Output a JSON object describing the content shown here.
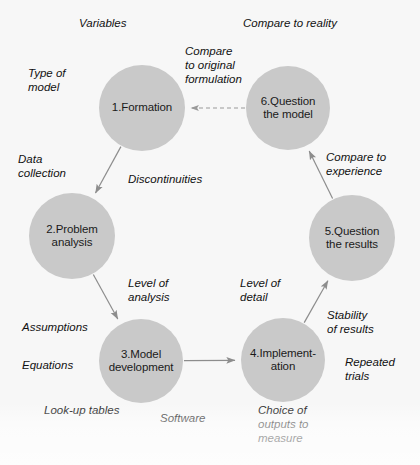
{
  "figure": {
    "background_color": "#f7f7f7",
    "node_color": "#c9c9c9",
    "text_color": "#111111"
  },
  "nodes": [
    {
      "id": "n1",
      "label": "1.Formation",
      "cx": 142,
      "cy": 108,
      "r": 43
    },
    {
      "id": "n2",
      "label": "2.Problem\nanalysis",
      "cx": 72,
      "cy": 236,
      "r": 43
    },
    {
      "id": "n3",
      "label": "3.Model\ndevelopment",
      "cx": 141,
      "cy": 361,
      "r": 42
    },
    {
      "id": "n4",
      "label": "4.Implement-\nation",
      "cx": 283,
      "cy": 360,
      "r": 42
    },
    {
      "id": "n5",
      "label": "5.Question\nthe results",
      "cx": 352,
      "cy": 238,
      "r": 43
    },
    {
      "id": "n6",
      "label": "6.Question\nthe model",
      "cx": 288,
      "cy": 108,
      "r": 42
    }
  ],
  "edges": [
    {
      "id": "e12",
      "from": "n1",
      "to": "n2",
      "style": "solid",
      "arrow": true
    },
    {
      "id": "e23",
      "from": "n2",
      "to": "n3",
      "style": "solid",
      "arrow": true
    },
    {
      "id": "e34",
      "from": "n3",
      "to": "n4",
      "style": "solid",
      "arrow": true
    },
    {
      "id": "e45",
      "from": "n4",
      "to": "n5",
      "style": "solid",
      "arrow": true
    },
    {
      "id": "e56",
      "from": "n5",
      "to": "n6",
      "style": "solid",
      "arrow": true
    },
    {
      "id": "e61",
      "from": "n6",
      "to": "n1",
      "style": "dashed",
      "arrow": true
    }
  ],
  "annotations": [
    {
      "id": "a-variables",
      "text": "Variables",
      "x": 79,
      "y": 16,
      "align": "left"
    },
    {
      "id": "a-compare-reality",
      "text": "Compare to reality",
      "x": 243,
      "y": 16,
      "align": "left"
    },
    {
      "id": "a-compare-original",
      "text": "Compare\nto original\nformulation",
      "x": 185,
      "y": 44,
      "align": "left"
    },
    {
      "id": "a-type-of-model",
      "text": "Type of\nmodel",
      "x": 28,
      "y": 66,
      "align": "left"
    },
    {
      "id": "a-data-collection",
      "text": "Data\ncollection",
      "x": 18,
      "y": 152,
      "align": "left"
    },
    {
      "id": "a-discontinuities",
      "text": "Discontinuities",
      "x": 128,
      "y": 172,
      "align": "left"
    },
    {
      "id": "a-compare-experience",
      "text": "Compare to\nexperience",
      "x": 326,
      "y": 150,
      "align": "left"
    },
    {
      "id": "a-level-of-analysis",
      "text": "Level of\nanalysis",
      "x": 128,
      "y": 276,
      "align": "left"
    },
    {
      "id": "a-level-of-detail",
      "text": "Level of\ndetail",
      "x": 240,
      "y": 276,
      "align": "left"
    },
    {
      "id": "a-stability-results",
      "text": "Stability\nof results",
      "x": 327,
      "y": 308,
      "align": "left"
    },
    {
      "id": "a-assumptions",
      "text": "Assumptions",
      "x": 22,
      "y": 320,
      "align": "left"
    },
    {
      "id": "a-equations",
      "text": "Equations",
      "x": 22,
      "y": 358,
      "align": "left"
    },
    {
      "id": "a-repeated-trials",
      "text": "Repeated\ntrials",
      "x": 345,
      "y": 355,
      "align": "left"
    },
    {
      "id": "a-lookup-tables",
      "text": "Look-up tables",
      "x": 44,
      "y": 403,
      "align": "left"
    },
    {
      "id": "a-software",
      "text": "Software",
      "x": 160,
      "y": 411,
      "align": "left"
    },
    {
      "id": "a-choice-outputs",
      "text": "Choice of\noutputs to\nmeasure",
      "x": 258,
      "y": 403,
      "align": "left"
    }
  ]
}
